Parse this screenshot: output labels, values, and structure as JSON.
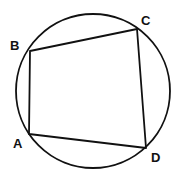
{
  "diagram": {
    "circle": {
      "cx": 93,
      "cy": 91,
      "r": 77
    },
    "stroke_color": "#111111",
    "vertices": [
      {
        "name": "A",
        "x": 29,
        "y": 134,
        "label_x": 13,
        "label_y": 148
      },
      {
        "name": "B",
        "x": 30,
        "y": 51,
        "label_x": 10,
        "label_y": 50
      },
      {
        "name": "C",
        "x": 137,
        "y": 29,
        "label_x": 141,
        "label_y": 25
      },
      {
        "name": "D",
        "x": 146,
        "y": 148,
        "label_x": 151,
        "label_y": 162
      }
    ],
    "edges": [
      [
        "A",
        "B"
      ],
      [
        "B",
        "C"
      ],
      [
        "C",
        "D"
      ],
      [
        "D",
        "A"
      ]
    ]
  }
}
